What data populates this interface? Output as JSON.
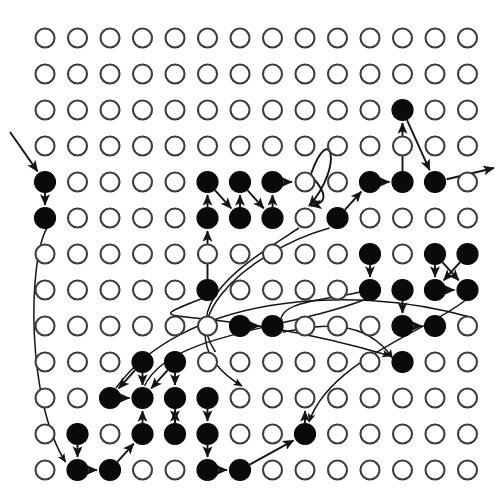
{
  "figure": {
    "title": "",
    "type": "lattice-graph",
    "background_color": "#ffffff",
    "node_fill_color": "#0a0a0a",
    "node_open_fill_color": "#ffffff",
    "node_stroke_color": "#3c3c3c",
    "edge_color": "#141414"
  },
  "grid": {
    "columns": 14,
    "rows": 13,
    "origin_x": 45,
    "origin_y": 38,
    "spacing_x": 32.5,
    "spacing_y": 36,
    "node_radius_open": 9.5,
    "node_radius_filled": 10.5
  },
  "filled_nodes": [
    [
      12,
      3
    ],
    [
      1,
      5
    ],
    [
      6,
      5
    ],
    [
      7,
      5
    ],
    [
      8,
      5
    ],
    [
      11,
      5
    ],
    [
      12,
      5
    ],
    [
      13,
      5
    ],
    [
      1,
      6
    ],
    [
      6,
      6
    ],
    [
      7,
      6
    ],
    [
      8,
      6
    ],
    [
      10,
      6
    ],
    [
      11,
      7
    ],
    [
      13,
      7
    ],
    [
      14,
      7
    ],
    [
      6,
      8
    ],
    [
      11,
      8
    ],
    [
      12,
      8
    ],
    [
      13,
      8
    ],
    [
      14,
      8
    ],
    [
      7,
      9
    ],
    [
      8,
      9
    ],
    [
      12,
      9
    ],
    [
      13,
      9
    ],
    [
      4,
      10
    ],
    [
      5,
      10
    ],
    [
      12,
      10
    ],
    [
      3,
      11
    ],
    [
      4,
      11
    ],
    [
      5,
      11
    ],
    [
      6,
      11
    ],
    [
      2,
      12
    ],
    [
      4,
      12
    ],
    [
      5,
      12
    ],
    [
      6,
      12
    ],
    [
      9,
      12
    ],
    [
      2,
      13
    ],
    [
      3,
      13
    ],
    [
      6,
      13
    ],
    [
      7,
      13
    ]
  ],
  "edges": [
    {
      "from": "external-left",
      "to": [
        1,
        5
      ],
      "style": "straight-arrow"
    },
    {
      "from": [
        1,
        5
      ],
      "to": [
        1,
        6
      ],
      "style": "straight-arrow"
    },
    {
      "from": [
        1,
        6
      ],
      "to": [
        2,
        12
      ],
      "style": "long-curve"
    },
    {
      "from": [
        6,
        6
      ],
      "to": [
        6,
        5
      ],
      "style": "straight-arrow"
    },
    {
      "from": [
        6,
        5
      ],
      "to": [
        7,
        6
      ],
      "style": "straight-arrow"
    },
    {
      "from": [
        7,
        6
      ],
      "to": [
        7,
        5
      ],
      "style": "straight-arrow"
    },
    {
      "from": [
        7,
        5
      ],
      "to": [
        8,
        6
      ],
      "style": "straight-arrow"
    },
    {
      "from": [
        8,
        6
      ],
      "to": [
        8,
        5
      ],
      "style": "straight-arrow"
    },
    {
      "from": [
        8,
        5
      ],
      "to": [
        9,
        5
      ],
      "style": "straight-arrow"
    },
    {
      "from": [
        9,
        5
      ],
      "to": [
        9,
        3
      ],
      "style": "curve"
    },
    {
      "from": [
        9,
        3
      ],
      "to": [
        9,
        6
      ],
      "style": "curve-down"
    },
    {
      "from": [
        6,
        8
      ],
      "to": [
        6,
        6
      ],
      "style": "straight-arrow"
    },
    {
      "from": [
        6,
        8
      ],
      "to": [
        12,
        10
      ],
      "style": "long-curve"
    },
    {
      "from": [
        10,
        6
      ],
      "to": [
        11,
        5
      ],
      "style": "straight-arrow"
    },
    {
      "from": [
        11,
        5
      ],
      "to": [
        12,
        5
      ],
      "style": "straight-arrow"
    },
    {
      "from": [
        12,
        5
      ],
      "to": [
        12,
        3
      ],
      "style": "straight-arrow"
    },
    {
      "from": [
        12,
        3
      ],
      "to": [
        13,
        5
      ],
      "style": "straight-arrow"
    },
    {
      "from": [
        13,
        5
      ],
      "to": "external-right",
      "style": "straight-arrow"
    },
    {
      "from": [
        10,
        6
      ],
      "to": [
        7,
        11
      ],
      "style": "long-curve"
    },
    {
      "from": [
        11,
        7
      ],
      "to": [
        11,
        8
      ],
      "style": "straight-arrow"
    },
    {
      "from": [
        13,
        7
      ],
      "to": [
        13,
        8
      ],
      "style": "straight-arrow"
    },
    {
      "from": [
        13,
        7
      ],
      "to": [
        14,
        8
      ],
      "style": "straight-arrow"
    },
    {
      "from": [
        14,
        7
      ],
      "to": [
        13,
        8
      ],
      "style": "straight-arrow"
    },
    {
      "from": [
        13,
        8
      ],
      "to": [
        14,
        8
      ],
      "style": "straight-arrow"
    },
    {
      "from": [
        12,
        8
      ],
      "to": [
        12,
        9
      ],
      "style": "straight-arrow"
    },
    {
      "from": [
        12,
        9
      ],
      "to": [
        13,
        9
      ],
      "style": "straight-arrow"
    },
    {
      "from": [
        11,
        8
      ],
      "to": [
        8,
        9
      ],
      "style": "curve"
    },
    {
      "from": [
        7,
        9
      ],
      "to": [
        8,
        9
      ],
      "style": "straight-arrow"
    },
    {
      "from": [
        8,
        9
      ],
      "to": [
        12,
        10
      ],
      "style": "curve"
    },
    {
      "from": [
        4,
        10
      ],
      "to": [
        3,
        11
      ],
      "style": "straight-arrow"
    },
    {
      "from": [
        5,
        10
      ],
      "to": [
        4,
        11
      ],
      "style": "straight-arrow"
    },
    {
      "from": [
        3,
        11
      ],
      "to": [
        4,
        11
      ],
      "style": "straight-arrow"
    },
    {
      "from": [
        4,
        12
      ],
      "to": [
        4,
        11
      ],
      "style": "straight-arrow"
    },
    {
      "from": [
        5,
        11
      ],
      "to": [
        5,
        12
      ],
      "style": "straight-arrow"
    },
    {
      "from": [
        6,
        11
      ],
      "to": [
        6,
        12
      ],
      "style": "straight-arrow"
    },
    {
      "from": [
        5,
        12
      ],
      "to": [
        5,
        11
      ],
      "style": "straight-arrow"
    },
    {
      "from": [
        6,
        12
      ],
      "to": [
        6,
        13
      ],
      "style": "straight-arrow"
    },
    {
      "from": [
        6,
        13
      ],
      "to": [
        7,
        13
      ],
      "style": "straight-arrow"
    },
    {
      "from": [
        7,
        13
      ],
      "to": [
        9,
        12
      ],
      "style": "straight-arrow"
    },
    {
      "from": [
        2,
        12
      ],
      "to": [
        2,
        13
      ],
      "style": "straight-arrow"
    },
    {
      "from": [
        2,
        13
      ],
      "to": [
        2,
        12
      ],
      "style": "straight-arrow"
    },
    {
      "from": [
        2,
        12
      ],
      "to": [
        3,
        13
      ],
      "style": "straight-arrow"
    },
    {
      "from": [
        3,
        13
      ],
      "to": [
        4,
        12
      ],
      "style": "straight-arrow"
    },
    {
      "from": [
        5,
        10
      ],
      "to": [
        5,
        11
      ],
      "style": "straight-arrow"
    },
    {
      "from": [
        4,
        10
      ],
      "to": [
        4,
        11
      ],
      "style": "straight-arrow"
    }
  ],
  "counts": {
    "total_nodes": 182,
    "filled_nodes": 41,
    "open_nodes": 141
  }
}
